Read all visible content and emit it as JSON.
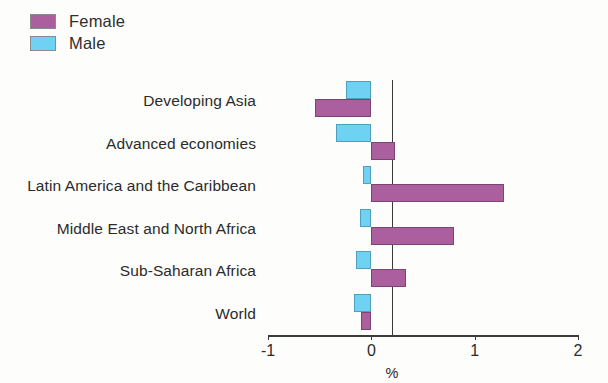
{
  "legend": {
    "position": "top-left",
    "entries": [
      {
        "label": "Female",
        "color": "#ab5f9e"
      },
      {
        "label": "Male",
        "color": "#6fd2f2"
      }
    ]
  },
  "axis": {
    "title": "%",
    "ticks": [
      "-1",
      "0",
      "1",
      "2"
    ],
    "tick_values": [
      -1,
      0,
      1,
      2
    ]
  },
  "chart_data": {
    "type": "bar",
    "orientation": "horizontal",
    "title": "",
    "subtitle": "",
    "xlabel": "%",
    "ylabel": "",
    "xlim": [
      -1,
      2
    ],
    "grid": false,
    "legend_position": "top-left",
    "categories": [
      "Developing Asia",
      "Advanced economies",
      "Latin America and the Caribbean",
      "Middle East and North Africa",
      "Sub-Saharan Africa",
      "World"
    ],
    "series": [
      {
        "name": "Female",
        "color": "#ab5f9e",
        "values": [
          -0.55,
          0.23,
          1.28,
          0.8,
          0.34,
          -0.1
        ]
      },
      {
        "name": "Male",
        "color": "#6fd2f2",
        "values": [
          -0.25,
          -0.34,
          -0.08,
          -0.11,
          -0.15,
          -0.17
        ]
      }
    ]
  }
}
